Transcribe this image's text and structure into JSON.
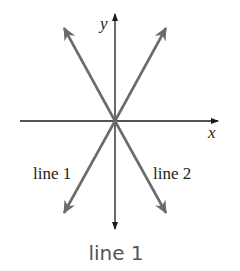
{
  "diagram": {
    "axes": {
      "x_label": "x",
      "y_label": "y"
    },
    "lines": [
      {
        "name": "line 1",
        "label": "line 1",
        "from": [
          64,
          213
        ],
        "to": [
          166,
          28
        ]
      },
      {
        "name": "line 2",
        "label": "line 2",
        "from": [
          64,
          28
        ],
        "to": [
          166,
          213
        ]
      }
    ],
    "colors": {
      "axis": "#1a1a1a",
      "lines": "#6b6b6b",
      "caption": "#555555"
    }
  },
  "caption": "line 1"
}
